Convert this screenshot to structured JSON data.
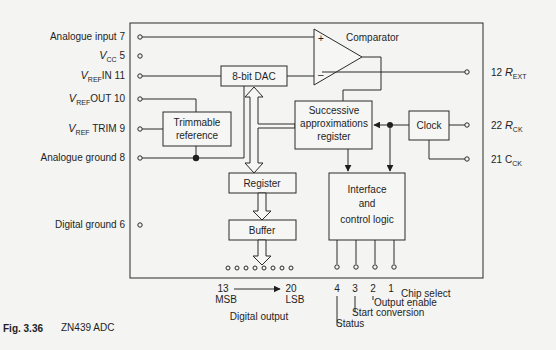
{
  "figure": {
    "number": "Fig. 3.36",
    "caption": "ZN439 ADC"
  },
  "left_pins": [
    {
      "name": "Analogue input",
      "pin": "7"
    },
    {
      "name_main": "V",
      "name_sub": "CC",
      "pin": "5"
    },
    {
      "name_main": "V",
      "name_sub": "REF",
      "name_suffix": "IN",
      "pin": "11"
    },
    {
      "name_main": "V",
      "name_sub": "REF",
      "name_suffix": "OUT",
      "pin": "10"
    },
    {
      "name_main": "V",
      "name_sub": "REF",
      "name_suffix": "TRIM",
      "pin": "9"
    },
    {
      "name": "Analogue ground",
      "pin": "8"
    },
    {
      "name": "Digital ground",
      "pin": "6"
    }
  ],
  "right_pins": [
    {
      "pin": "12",
      "name_main": "R",
      "name_sub": "EXT"
    },
    {
      "pin": "22",
      "name_main": "R",
      "name_sub": "CK"
    },
    {
      "pin": "21",
      "name_main": "C",
      "name_sub": "CK"
    }
  ],
  "blocks": {
    "comparator": "Comparator",
    "comparator_plus": "+",
    "comparator_minus": "–",
    "dac": "8-bit DAC",
    "trimmable_reference": [
      "Trimmable",
      "reference"
    ],
    "sar": [
      "Successive",
      "approximations",
      "register"
    ],
    "clock": "Clock",
    "register": "Register",
    "buffer": "Buffer",
    "interface": [
      "Interface",
      "and",
      "control logic"
    ]
  },
  "digital_output": {
    "msb_pin": "13",
    "msb_label": "MSB",
    "lsb_pin": "20",
    "lsb_label": "LSB",
    "label": "Digital output",
    "pin_count": 8
  },
  "control_pins": [
    {
      "pin": "4",
      "name": "Status"
    },
    {
      "pin": "3",
      "name": "Start conversion"
    },
    {
      "pin": "2",
      "name": "Output enable"
    },
    {
      "pin": "1",
      "name": "Chip select"
    }
  ]
}
